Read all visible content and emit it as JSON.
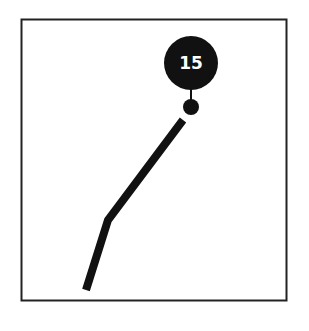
{
  "diagram": {
    "marker_label": "15",
    "colors": {
      "ink": "#111111",
      "background": "#ffffff",
      "label": "#ffffff"
    },
    "frame": {
      "x": 21,
      "y": 19,
      "width": 266,
      "height": 282
    },
    "path_points": [
      [
        86,
        290
      ],
      [
        108,
        220
      ],
      [
        183,
        120
      ]
    ],
    "marker": {
      "cx": 191,
      "cy": 63,
      "r": 27
    },
    "end_dot": {
      "cx": 191,
      "cy": 107,
      "r": 8
    }
  }
}
